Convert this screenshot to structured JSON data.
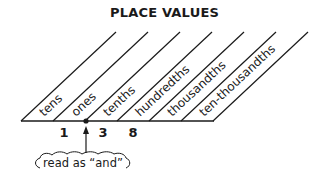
{
  "title": "PLACE VALUES",
  "places": [
    {
      "label": "tens"
    },
    {
      "label": "ones"
    },
    {
      "label": "tenths"
    },
    {
      "label": "hundredths"
    },
    {
      "label": "thousandths"
    },
    {
      "label": "ten-thousandths"
    }
  ],
  "digits": [
    {
      "value": "1",
      "place": "ones"
    },
    {
      "value": "3",
      "place": "tenths"
    },
    {
      "value": "8",
      "place": "hundredths"
    }
  ],
  "decimal_point_note": "read as “and”"
}
